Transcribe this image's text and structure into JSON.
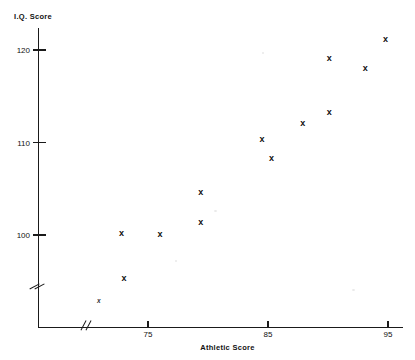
{
  "chart_data": {
    "type": "scatter",
    "title": "",
    "xlabel": "Athletic Score",
    "ylabel": "I.Q. Score",
    "xlim": [
      70.6,
      95.9
    ],
    "ylim": [
      92.0,
      123.5
    ],
    "grid": false,
    "legend": null,
    "axis_breaks": {
      "x": true,
      "y": true
    },
    "xticks": [
      75,
      85,
      95
    ],
    "xticklabels": [
      "75",
      "85",
      "95"
    ],
    "yticks": [
      100,
      110,
      120
    ],
    "yticklabels": [
      "100",
      "110",
      "120"
    ],
    "marker_symbol": "x",
    "points": [
      {
        "x": 72.8,
        "y": 100.2
      },
      {
        "x": 73.0,
        "y": 95.3
      },
      {
        "x": 76.0,
        "y": 100.1
      },
      {
        "x": 79.4,
        "y": 104.7
      },
      {
        "x": 79.4,
        "y": 101.4
      },
      {
        "x": 84.5,
        "y": 110.4
      },
      {
        "x": 85.3,
        "y": 108.3
      },
      {
        "x": 87.9,
        "y": 112.1
      },
      {
        "x": 90.1,
        "y": 113.3
      },
      {
        "x": 90.1,
        "y": 119.1
      },
      {
        "x": 93.1,
        "y": 118.1
      },
      {
        "x": 94.8,
        "y": 121.2
      }
    ],
    "offscale_points": [
      {
        "x": 70.9,
        "y": 92.9,
        "note": "marker below y-axis break"
      }
    ]
  },
  "axes": {
    "y_title": "I.Q. Score",
    "x_title": "Athletic Score",
    "y_tick_labels": [
      "120",
      "110",
      "100"
    ],
    "x_tick_labels": [
      "75",
      "85",
      "95"
    ]
  },
  "markers": {
    "glyph": "x",
    "small_glyph": "x"
  }
}
